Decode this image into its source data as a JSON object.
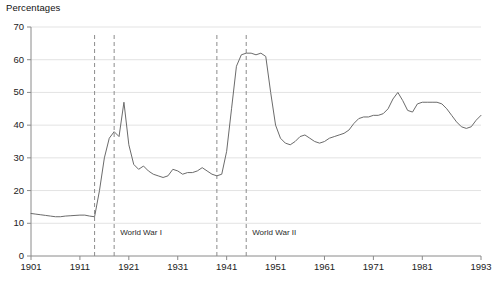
{
  "chart_data": {
    "type": "line",
    "title": "",
    "ylabel": "Percentages",
    "xlabel": "",
    "ylim": [
      0,
      70
    ],
    "xlim": [
      1901,
      1993
    ],
    "grid": true,
    "legend_position": "none",
    "y_ticks": [
      0,
      10,
      20,
      30,
      40,
      50,
      60,
      70
    ],
    "x_ticks": [
      1901,
      1911,
      1921,
      1931,
      1941,
      1951,
      1961,
      1971,
      1981,
      1993
    ],
    "annotations": [
      {
        "label": "World War I",
        "start": 1914,
        "end": 1918
      },
      {
        "label": "World War II",
        "start": 1939,
        "end": 1945
      }
    ],
    "series": [
      {
        "name": "Percentages",
        "x": [
          1901,
          1902,
          1903,
          1904,
          1905,
          1906,
          1907,
          1908,
          1909,
          1910,
          1911,
          1912,
          1913,
          1914,
          1915,
          1916,
          1917,
          1918,
          1919,
          1920,
          1921,
          1922,
          1923,
          1924,
          1925,
          1926,
          1927,
          1928,
          1929,
          1930,
          1931,
          1932,
          1933,
          1934,
          1935,
          1936,
          1937,
          1938,
          1939,
          1940,
          1941,
          1942,
          1943,
          1944,
          1945,
          1946,
          1947,
          1948,
          1949,
          1950,
          1951,
          1952,
          1953,
          1954,
          1955,
          1956,
          1957,
          1958,
          1959,
          1960,
          1961,
          1962,
          1963,
          1964,
          1965,
          1966,
          1967,
          1968,
          1969,
          1970,
          1971,
          1972,
          1973,
          1974,
          1975,
          1976,
          1977,
          1978,
          1979,
          1980,
          1981,
          1982,
          1983,
          1984,
          1985,
          1986,
          1987,
          1988,
          1989,
          1990,
          1991,
          1992,
          1993
        ],
        "values": [
          13.0,
          12.8,
          12.6,
          12.4,
          12.2,
          12.0,
          12.0,
          12.2,
          12.3,
          12.4,
          12.5,
          12.5,
          12.2,
          12.0,
          20.0,
          30.0,
          36.0,
          38.0,
          36.5,
          47.0,
          34.0,
          28.0,
          26.5,
          27.5,
          26.0,
          25.0,
          24.5,
          24.0,
          24.5,
          26.5,
          26.0,
          25.0,
          25.5,
          25.5,
          26.0,
          27.0,
          26.0,
          25.0,
          24.5,
          25.0,
          32.0,
          45.0,
          58.0,
          61.5,
          62.0,
          62.0,
          61.5,
          62.0,
          61.0,
          50.0,
          40.0,
          36.0,
          34.5,
          34.0,
          35.0,
          36.5,
          37.0,
          36.0,
          35.0,
          34.5,
          35.0,
          36.0,
          36.5,
          37.0,
          37.5,
          38.5,
          40.5,
          42.0,
          42.5,
          42.5,
          43.0,
          43.0,
          43.5,
          45.0,
          48.0,
          50.0,
          47.5,
          44.5,
          44.0,
          46.5,
          47.0,
          47.0,
          47.0,
          47.0,
          46.5,
          45.0,
          43.0,
          41.0,
          39.5,
          39.0,
          39.5,
          41.5,
          43.0
        ]
      }
    ],
    "line_color": "#6b6b6b",
    "grid_color": "#e3e3e3",
    "axis_color": "#8a8a8a",
    "dash_color": "#8c8c8c"
  },
  "footnote": {
    "text": ""
  },
  "axis": {
    "y_title": "Percentages"
  }
}
